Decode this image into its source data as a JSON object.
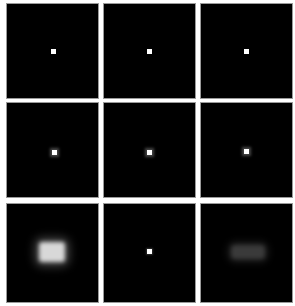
{
  "figure": {
    "layout": {
      "rows": 3,
      "cols": 3
    },
    "panels": [
      {
        "row": 0,
        "col": 0,
        "content": "point",
        "brightness": "sharp"
      },
      {
        "row": 0,
        "col": 1,
        "content": "point",
        "brightness": "sharp"
      },
      {
        "row": 0,
        "col": 2,
        "content": "point",
        "brightness": "sharp"
      },
      {
        "row": 1,
        "col": 0,
        "content": "point",
        "brightness": "slightly-blurred"
      },
      {
        "row": 1,
        "col": 1,
        "content": "point",
        "brightness": "slightly-blurred"
      },
      {
        "row": 1,
        "col": 2,
        "content": "point",
        "brightness": "slightly-blurred"
      },
      {
        "row": 2,
        "col": 0,
        "content": "blob",
        "brightness": "bright-blurred"
      },
      {
        "row": 2,
        "col": 1,
        "content": "point",
        "brightness": "sharp"
      },
      {
        "row": 2,
        "col": 2,
        "content": "blob",
        "brightness": "dim-blurred"
      }
    ],
    "colors": {
      "background": "#ffffff",
      "panel": "#000000",
      "point": "#ffffff",
      "border": "#9a9a9a"
    }
  }
}
